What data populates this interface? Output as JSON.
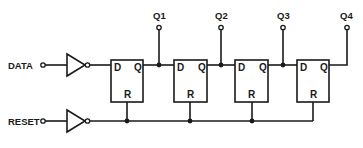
{
  "diagram": {
    "type": "4-bit shift register (D flip-flops with common reset)",
    "inputs": [
      {
        "label": "DATA"
      },
      {
        "label": "RESET"
      }
    ],
    "outputs": [
      {
        "label": "Q1"
      },
      {
        "label": "Q2"
      },
      {
        "label": "Q3"
      },
      {
        "label": "Q4"
      }
    ],
    "flipflops": [
      {
        "d": "D",
        "q": "Q",
        "r": "R"
      },
      {
        "d": "D",
        "q": "Q",
        "r": "R"
      },
      {
        "d": "D",
        "q": "Q",
        "r": "R"
      },
      {
        "d": "D",
        "q": "Q",
        "r": "R"
      }
    ],
    "colors": {
      "ink": "#1a1a1a",
      "background": "#ffffff"
    }
  }
}
